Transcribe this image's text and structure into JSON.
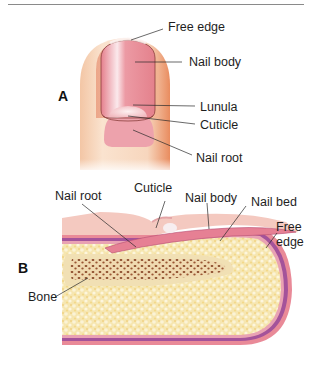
{
  "figure": {
    "part_a": {
      "label": "A",
      "title": "Fingernail, dorsal view",
      "callouts": [
        {
          "text": "Free edge"
        },
        {
          "text": "Nail body"
        },
        {
          "text": "Lunula"
        },
        {
          "text": "Cuticle"
        },
        {
          "text": "Nail root"
        }
      ]
    },
    "part_b": {
      "label": "B",
      "title": "Fingertip, sagittal section",
      "callouts": [
        {
          "text": "Nail root"
        },
        {
          "text": "Cuticle"
        },
        {
          "text": "Nail body"
        },
        {
          "text": "Nail bed"
        },
        {
          "text": "Free edge",
          "lines": [
            "Free",
            "edge"
          ]
        },
        {
          "text": "Bone"
        }
      ]
    },
    "colors": {
      "skin": "#f6dcc4",
      "skin_shadow": "#e8885e",
      "nail_pink": "#e98a95",
      "nail_highlight": "#f9e6e8",
      "nail_root": "#eda2ac",
      "dermis_purple": "#a4539a",
      "epidermis_pink": "#ec8c9a",
      "fat_yellow": "#f5e3a6",
      "bone_tan": "#f1e0b4",
      "marrow_brown": "#8a4a2a",
      "leader_line": "#2a2a2a"
    }
  }
}
